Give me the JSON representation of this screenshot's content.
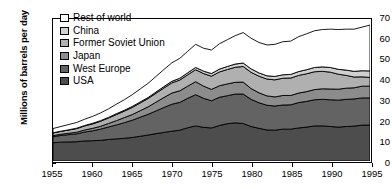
{
  "chart_data": {
    "type": "area",
    "stacked": true,
    "title": "",
    "xlabel": "",
    "ylabel": "Millions of barrels per day",
    "xlim": [
      1955,
      1995
    ],
    "ylim": [
      0,
      70
    ],
    "ytick_values": [
      0,
      10,
      20,
      30,
      40,
      50,
      60,
      70
    ],
    "xtick_values": [
      1955,
      1960,
      1965,
      1970,
      1975,
      1980,
      1985,
      1990,
      1995
    ],
    "grid": false,
    "legend_position": "top-left",
    "x": [
      1955,
      1956,
      1957,
      1958,
      1959,
      1960,
      1961,
      1962,
      1963,
      1964,
      1965,
      1966,
      1967,
      1968,
      1969,
      1970,
      1971,
      1972,
      1973,
      1974,
      1975,
      1976,
      1977,
      1978,
      1979,
      1980,
      1981,
      1982,
      1983,
      1984,
      1985,
      1986,
      1987,
      1988,
      1989,
      1990,
      1991,
      1992,
      1993,
      1994,
      1995
    ],
    "series": [
      {
        "name": "USA",
        "color": "#4d4d4d",
        "values": [
          9.0,
          9.3,
          9.4,
          9.5,
          9.9,
          10.0,
          10.2,
          10.6,
          10.9,
          11.2,
          11.6,
          12.2,
          12.8,
          13.5,
          14.1,
          14.7,
          15.2,
          16.4,
          17.3,
          16.6,
          16.3,
          17.5,
          18.4,
          18.8,
          18.5,
          17.0,
          16.1,
          15.3,
          15.2,
          15.7,
          15.7,
          16.3,
          16.7,
          17.3,
          17.3,
          17.0,
          16.7,
          17.0,
          17.2,
          17.7,
          17.7
        ]
      },
      {
        "name": "West Europe",
        "color": "#636363",
        "values": [
          3.0,
          3.3,
          3.6,
          3.9,
          4.4,
          4.9,
          5.5,
          6.2,
          6.9,
          7.7,
          8.5,
          9.4,
          10.2,
          11.2,
          12.3,
          13.3,
          13.7,
          14.5,
          15.4,
          14.3,
          13.4,
          13.9,
          13.8,
          14.2,
          14.5,
          13.4,
          12.6,
          12.2,
          11.9,
          11.9,
          12.0,
          12.5,
          12.7,
          12.9,
          13.1,
          13.2,
          13.3,
          13.4,
          13.4,
          13.4,
          13.4
        ]
      },
      {
        "name": "Japan",
        "color": "#8c8c8c",
        "values": [
          0.5,
          0.6,
          0.7,
          0.8,
          1.0,
          1.2,
          1.4,
          1.7,
          2.1,
          2.5,
          2.8,
          3.2,
          3.7,
          4.3,
          4.9,
          5.5,
          5.7,
          6.0,
          6.4,
          6.0,
          5.6,
          5.7,
          5.8,
          5.8,
          5.9,
          5.3,
          4.9,
          4.6,
          4.5,
          4.7,
          4.6,
          4.7,
          4.8,
          5.0,
          5.2,
          5.3,
          5.4,
          5.5,
          5.5,
          5.8,
          5.8
        ]
      },
      {
        "name": "Former Soviet Union",
        "color": "#b0b0b0",
        "values": [
          1.3,
          1.4,
          1.6,
          1.8,
          2.0,
          2.2,
          2.5,
          2.7,
          3.0,
          3.2,
          3.5,
          3.8,
          4.1,
          4.4,
          4.7,
          5.0,
          5.3,
          5.6,
          5.9,
          6.2,
          6.5,
          6.8,
          7.1,
          7.4,
          7.7,
          8.0,
          8.2,
          8.3,
          8.4,
          8.5,
          8.6,
          8.7,
          8.8,
          8.8,
          8.6,
          8.3,
          7.4,
          6.3,
          5.3,
          4.6,
          4.3
        ]
      },
      {
        "name": "China",
        "color": "#d0d0d0",
        "values": [
          0.1,
          0.1,
          0.1,
          0.2,
          0.2,
          0.3,
          0.3,
          0.3,
          0.4,
          0.4,
          0.5,
          0.5,
          0.5,
          0.6,
          0.7,
          0.8,
          0.9,
          1.0,
          1.1,
          1.2,
          1.3,
          1.4,
          1.5,
          1.6,
          1.7,
          1.7,
          1.6,
          1.6,
          1.7,
          1.7,
          1.8,
          1.9,
          2.0,
          2.1,
          2.2,
          2.3,
          2.4,
          2.6,
          2.8,
          3.0,
          3.2
        ]
      },
      {
        "name": "Rest of world",
        "color": "#ffffff",
        "values": [
          2.1,
          2.3,
          2.6,
          2.8,
          3.1,
          3.4,
          3.8,
          4.2,
          4.7,
          5.2,
          5.8,
          6.4,
          7.0,
          7.7,
          8.4,
          9.1,
          9.8,
          10.6,
          11.4,
          11.3,
          11.6,
          12.5,
          13.2,
          14.0,
          15.0,
          15.1,
          15.0,
          15.2,
          15.8,
          16.3,
          16.4,
          17.2,
          17.7,
          18.1,
          18.4,
          18.9,
          19.6,
          20.2,
          20.8,
          21.5,
          22.6
        ]
      }
    ],
    "legend": [
      {
        "label": "Rest of world",
        "color": "#ffffff"
      },
      {
        "label": "China",
        "color": "#d0d0d0"
      },
      {
        "label": "Former Soviet Union",
        "color": "#b0b0b0"
      },
      {
        "label": "Japan",
        "color": "#8c8c8c"
      },
      {
        "label": "West Europe",
        "color": "#636363"
      },
      {
        "label": "USA",
        "color": "#4d4d4d"
      }
    ]
  }
}
